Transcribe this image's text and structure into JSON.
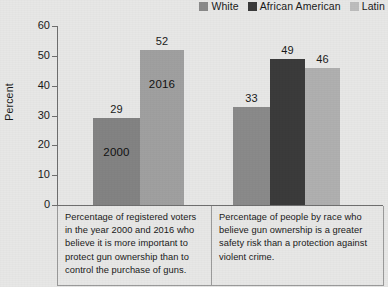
{
  "legend": {
    "items": [
      {
        "label": "White",
        "color": "#8a8a8a",
        "icon": "legend-swatch-icon"
      },
      {
        "label": "African American",
        "color": "#3b3b3b",
        "icon": "legend-swatch-icon"
      },
      {
        "label": "Latin",
        "color": "#bdbdbd",
        "icon": "legend-swatch-icon"
      }
    ]
  },
  "chart_data": {
    "type": "bar",
    "title": "",
    "xlabel": "",
    "ylabel": "Percent",
    "ylim": [
      0,
      60
    ],
    "yticks": [
      0,
      10,
      20,
      30,
      40,
      50,
      60
    ],
    "grid": false,
    "legend_position": "top-right",
    "groups": [
      {
        "caption": "Percentage of registered voters in the year 2000 and 2016 who believe it is more important to protect gun ownership than to control the purchase of guns.",
        "bars": [
          {
            "name": "2000",
            "value": 29,
            "value_label": "29",
            "inner_label": "2000",
            "color": "#838383"
          },
          {
            "name": "2016",
            "value": 52,
            "value_label": "52",
            "inner_label": "2016",
            "color": "#a0a0a0"
          }
        ]
      },
      {
        "caption": "Percentage of people by race who believe gun ownership is a greater safety risk than a protection against violent crime.",
        "bars": [
          {
            "name": "White",
            "value": 33,
            "value_label": "33",
            "inner_label": "",
            "color": "#8a8a8a"
          },
          {
            "name": "African American",
            "value": 49,
            "value_label": "49",
            "inner_label": "",
            "color": "#3b3b3b"
          },
          {
            "name": "Latin",
            "value": 46,
            "value_label": "46",
            "inner_label": "",
            "color": "#b0b0b0"
          }
        ]
      }
    ]
  }
}
